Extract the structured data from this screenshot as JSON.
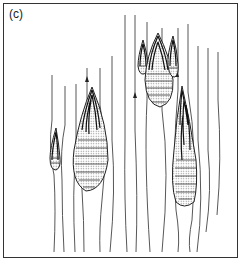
{
  "figure": {
    "panel_label": "(c)",
    "colors": {
      "line": "#444444",
      "border": "#333333",
      "fill_stipple": "#bbbbbb",
      "background": "#ffffff"
    },
    "elements": {
      "streamline_count": 15,
      "arrow_count": 3,
      "drop_structures": [
        {
          "id": "small-left",
          "cx": 55,
          "top": 128,
          "bottom": 170
        },
        {
          "id": "large-center-left",
          "cx": 92,
          "top": 87,
          "bottom": 191
        },
        {
          "id": "small-top-1",
          "cx": 143,
          "top": 40,
          "bottom": 75
        },
        {
          "id": "large-top-center",
          "cx": 158,
          "top": 33,
          "bottom": 107
        },
        {
          "id": "small-top-2",
          "cx": 173,
          "top": 36,
          "bottom": 78
        },
        {
          "id": "large-right",
          "cx": 183,
          "top": 86,
          "bottom": 208
        }
      ]
    }
  }
}
